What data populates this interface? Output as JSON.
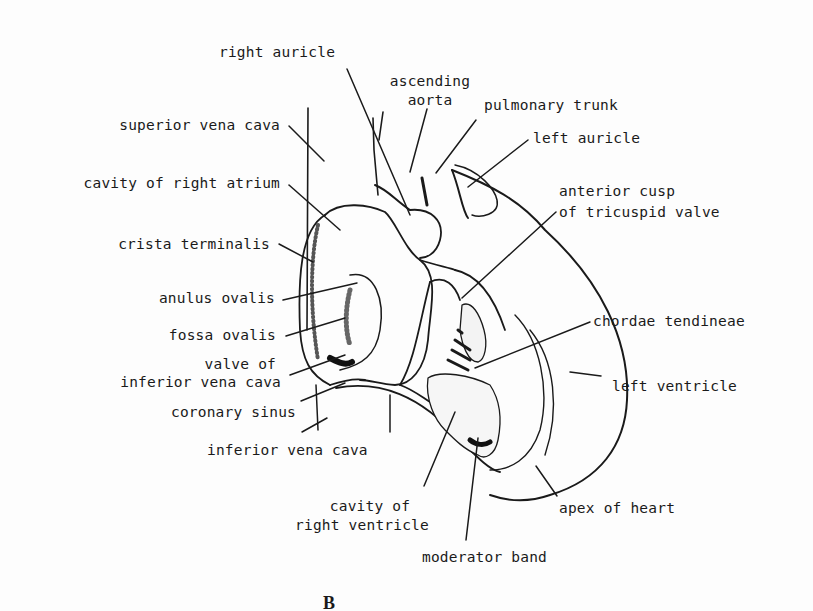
{
  "figure": {
    "panel_letter": "B",
    "labels": {
      "right_auricle": "right auricle",
      "ascending_aorta_1": "ascending",
      "ascending_aorta_2": "aorta",
      "pulmonary_trunk": "pulmonary trunk",
      "left_auricle": "left auricle",
      "superior_vena_cava": "superior vena cava",
      "cavity_right_atrium": "cavity of right atrium",
      "anterior_cusp_1": "anterior cusp",
      "anterior_cusp_2": "of tricuspid valve",
      "crista_terminalis": "crista terminalis",
      "anulus_ovalis": "anulus ovalis",
      "fossa_ovalis": "fossa ovalis",
      "chordae_tendineae": "chordae tendineae",
      "valve_ivc_1": "valve of",
      "valve_ivc_2": "inferior vena cava",
      "left_ventricle": "left ventricle",
      "coronary_sinus": "coronary sinus",
      "inferior_vena_cava": "inferior vena cava",
      "cavity_right_ventricle_1": "cavity of",
      "cavity_right_ventricle_2": "right ventricle",
      "apex_of_heart": "apex of heart",
      "moderator_band": "moderator band"
    }
  }
}
